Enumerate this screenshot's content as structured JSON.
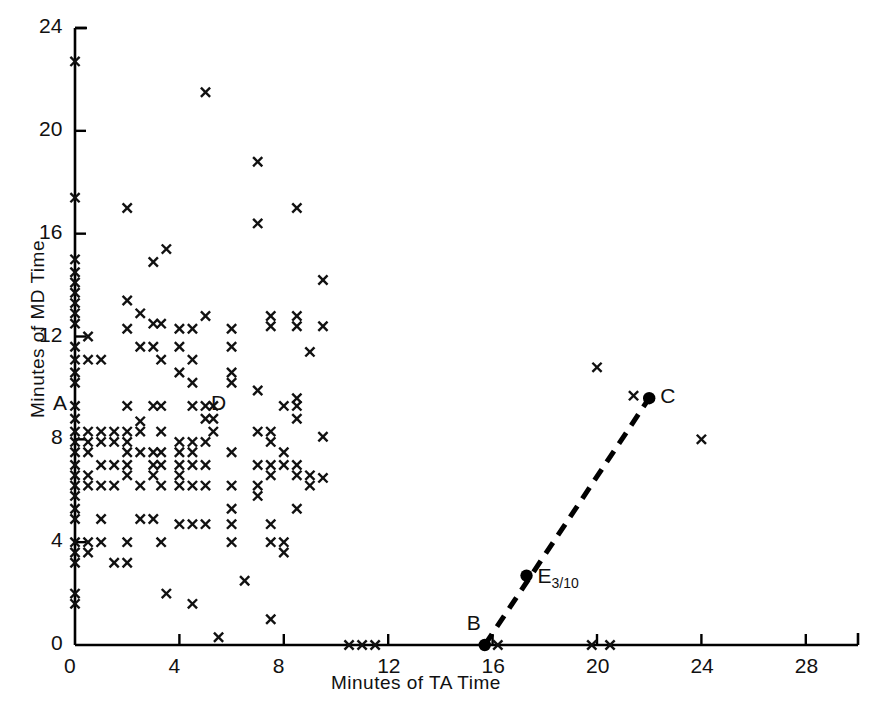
{
  "chart_data": {
    "type": "scatter",
    "title": "",
    "xlabel": "Minutes of TA Time",
    "ylabel": "Minutes of MD Time",
    "xlim": [
      0,
      30
    ],
    "ylim": [
      0,
      24
    ],
    "xticks": [
      0,
      4,
      8,
      12,
      16,
      20,
      24,
      28
    ],
    "xticklabels": [
      "0",
      "4",
      "8",
      "12",
      "16",
      "20",
      "24",
      "28"
    ],
    "yticks": [
      0,
      4,
      8,
      12,
      16,
      20,
      24
    ],
    "yticklabels": [
      "0",
      "4",
      "8",
      "12",
      "16",
      "20",
      "24"
    ],
    "grid": false,
    "legend": null,
    "marker": "x",
    "series": [
      {
        "name": "observations",
        "marker": "x",
        "points": [
          [
            0,
            22.7
          ],
          [
            0,
            17.4
          ],
          [
            0,
            15.0
          ],
          [
            0,
            14.5
          ],
          [
            0,
            14.1
          ],
          [
            0,
            13.7
          ],
          [
            0,
            13.3
          ],
          [
            0,
            12.9
          ],
          [
            0,
            12.5
          ],
          [
            0,
            11.6
          ],
          [
            0,
            11.1
          ],
          [
            0,
            10.6
          ],
          [
            0,
            10.2
          ],
          [
            0,
            9.3
          ],
          [
            0,
            8.8
          ],
          [
            0,
            8.3
          ],
          [
            0,
            7.9
          ],
          [
            0,
            7.5
          ],
          [
            0,
            7.0
          ],
          [
            0,
            6.6
          ],
          [
            0,
            6.2
          ],
          [
            0,
            5.8
          ],
          [
            0,
            5.3
          ],
          [
            0,
            4.9
          ],
          [
            0,
            4.0
          ],
          [
            0,
            3.6
          ],
          [
            0,
            3.2
          ],
          [
            0,
            2.0
          ],
          [
            0,
            1.6
          ],
          [
            0.5,
            12.0
          ],
          [
            0.5,
            11.1
          ],
          [
            0.5,
            8.3
          ],
          [
            0.5,
            7.9
          ],
          [
            0.5,
            7.5
          ],
          [
            0.5,
            6.6
          ],
          [
            0.5,
            6.2
          ],
          [
            0.5,
            4.0
          ],
          [
            0.5,
            3.6
          ],
          [
            1.0,
            11.1
          ],
          [
            1.0,
            8.3
          ],
          [
            1.0,
            7.9
          ],
          [
            1.0,
            7.0
          ],
          [
            1.0,
            6.2
          ],
          [
            1.0,
            4.9
          ],
          [
            1.0,
            4.0
          ],
          [
            1.5,
            8.3
          ],
          [
            1.5,
            7.9
          ],
          [
            1.5,
            7.0
          ],
          [
            1.5,
            6.2
          ],
          [
            1.5,
            3.2
          ],
          [
            2.0,
            17.0
          ],
          [
            2.0,
            13.4
          ],
          [
            2.0,
            12.3
          ],
          [
            2.0,
            9.3
          ],
          [
            2.0,
            8.3
          ],
          [
            2.0,
            7.9
          ],
          [
            2.0,
            7.5
          ],
          [
            2.0,
            7.0
          ],
          [
            2.0,
            6.6
          ],
          [
            2.0,
            4.0
          ],
          [
            2.0,
            3.2
          ],
          [
            2.5,
            12.9
          ],
          [
            2.5,
            11.6
          ],
          [
            2.5,
            8.7
          ],
          [
            2.5,
            8.3
          ],
          [
            2.5,
            7.5
          ],
          [
            2.5,
            6.2
          ],
          [
            2.5,
            4.9
          ],
          [
            3.0,
            14.9
          ],
          [
            3.0,
            12.5
          ],
          [
            3.0,
            11.6
          ],
          [
            3.0,
            9.3
          ],
          [
            3.0,
            7.5
          ],
          [
            3.0,
            7.0
          ],
          [
            3.0,
            6.6
          ],
          [
            3.0,
            4.9
          ],
          [
            3.3,
            12.5
          ],
          [
            3.3,
            11.1
          ],
          [
            3.3,
            9.3
          ],
          [
            3.3,
            8.3
          ],
          [
            3.3,
            7.5
          ],
          [
            3.3,
            7.0
          ],
          [
            3.3,
            6.2
          ],
          [
            3.3,
            4.0
          ],
          [
            3.5,
            15.4
          ],
          [
            3.5,
            2.0
          ],
          [
            4.0,
            12.3
          ],
          [
            4.0,
            11.6
          ],
          [
            4.0,
            10.6
          ],
          [
            4.0,
            7.9
          ],
          [
            4.0,
            7.5
          ],
          [
            4.0,
            7.0
          ],
          [
            4.0,
            6.6
          ],
          [
            4.0,
            6.2
          ],
          [
            4.0,
            4.7
          ],
          [
            4.5,
            12.3
          ],
          [
            4.5,
            11.1
          ],
          [
            4.5,
            10.2
          ],
          [
            4.5,
            9.3
          ],
          [
            4.5,
            7.9
          ],
          [
            4.5,
            7.5
          ],
          [
            4.5,
            7.0
          ],
          [
            4.5,
            6.2
          ],
          [
            4.5,
            4.7
          ],
          [
            4.5,
            1.6
          ],
          [
            5.0,
            21.5
          ],
          [
            5.0,
            12.8
          ],
          [
            5.0,
            9.3
          ],
          [
            5.0,
            8.8
          ],
          [
            5.0,
            7.9
          ],
          [
            5.0,
            7.0
          ],
          [
            5.0,
            6.2
          ],
          [
            5.0,
            4.7
          ],
          [
            5.3,
            9.3
          ],
          [
            5.3,
            8.8
          ],
          [
            5.3,
            8.3
          ],
          [
            5.5,
            0.3
          ],
          [
            6.0,
            12.3
          ],
          [
            6.0,
            11.6
          ],
          [
            6.0,
            10.6
          ],
          [
            6.0,
            10.2
          ],
          [
            6.0,
            7.5
          ],
          [
            6.0,
            6.2
          ],
          [
            6.0,
            5.3
          ],
          [
            6.0,
            4.7
          ],
          [
            6.0,
            4.0
          ],
          [
            6.5,
            2.5
          ],
          [
            7.0,
            18.8
          ],
          [
            7.0,
            16.4
          ],
          [
            7.0,
            9.9
          ],
          [
            7.0,
            8.3
          ],
          [
            7.0,
            7.0
          ],
          [
            7.0,
            6.2
          ],
          [
            7.0,
            5.8
          ],
          [
            7.5,
            12.8
          ],
          [
            7.5,
            12.4
          ],
          [
            7.5,
            8.3
          ],
          [
            7.5,
            7.9
          ],
          [
            7.5,
            7.0
          ],
          [
            7.5,
            6.6
          ],
          [
            7.5,
            4.7
          ],
          [
            7.5,
            4.0
          ],
          [
            7.5,
            1.0
          ],
          [
            8.0,
            9.3
          ],
          [
            8.0,
            7.5
          ],
          [
            8.0,
            7.0
          ],
          [
            8.0,
            4.0
          ],
          [
            8.0,
            3.6
          ],
          [
            8.5,
            17.0
          ],
          [
            8.5,
            12.8
          ],
          [
            8.5,
            12.4
          ],
          [
            8.5,
            9.6
          ],
          [
            8.5,
            9.3
          ],
          [
            8.5,
            8.8
          ],
          [
            8.5,
            7.0
          ],
          [
            8.5,
            6.6
          ],
          [
            8.5,
            5.3
          ],
          [
            9.0,
            11.4
          ],
          [
            9.0,
            6.6
          ],
          [
            9.0,
            6.2
          ],
          [
            9.5,
            14.2
          ],
          [
            9.5,
            12.4
          ],
          [
            9.5,
            8.1
          ],
          [
            9.5,
            6.5
          ],
          [
            10.5,
            0.0
          ],
          [
            11.0,
            0.0
          ],
          [
            11.5,
            0.0
          ],
          [
            16.2,
            0.0
          ],
          [
            19.8,
            0.0
          ],
          [
            20.5,
            0.0
          ],
          [
            20.0,
            10.8
          ],
          [
            21.4,
            9.7
          ],
          [
            24.0,
            8.0
          ]
        ]
      }
    ],
    "annotated_points": [
      {
        "label": "A",
        "x": 0,
        "y": 9.3,
        "marker": "none",
        "label_dx": -22,
        "label_dy": -1
      },
      {
        "label": "B",
        "x": 15.7,
        "y": 0.0,
        "marker": "dot",
        "label_dx": -18,
        "label_dy": -20
      },
      {
        "label": "C",
        "x": 22.0,
        "y": 9.6,
        "marker": "dot",
        "label_dx": 11,
        "label_dy": 0
      },
      {
        "label": "D",
        "x": 5.1,
        "y": 9.3,
        "marker": "none",
        "label_dx": 3,
        "label_dy": -1
      },
      {
        "label": "E",
        "sublabel": "3/10",
        "x": 17.3,
        "y": 2.7,
        "marker": "dot",
        "label_dx": 11,
        "label_dy": 2
      }
    ],
    "dashed_line": {
      "from_label": "B",
      "to_label": "C",
      "from": [
        15.7,
        0.0
      ],
      "to": [
        22.0,
        9.6
      ],
      "style": "dashed",
      "color": "#000000",
      "width": 5,
      "midpoint_label": "E"
    }
  }
}
